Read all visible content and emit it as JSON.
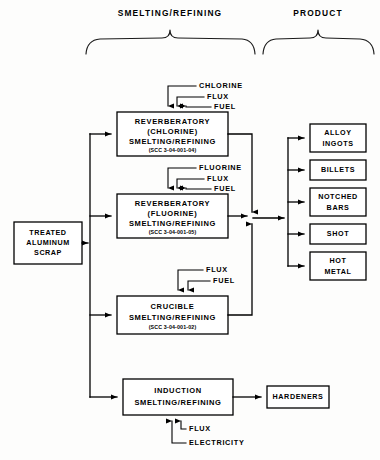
{
  "diagram": {
    "headers": [
      {
        "label": "SMELTING/REFINING",
        "x": 170,
        "y": 14
      },
      {
        "label": "PRODUCT",
        "x": 318,
        "y": 14
      }
    ],
    "feedstock": {
      "name": "treated-aluminum-scrap",
      "lines": [
        "TREATED",
        "ALUMINUM",
        "SCRAP"
      ],
      "x": 14,
      "y": 222,
      "w": 68,
      "h": 42
    },
    "processes": [
      {
        "name": "reverberatory-chlorine",
        "lines": [
          "REVERBERATORY",
          "(CHLORINE)",
          "SMELTING/REFINING"
        ],
        "scc": "(SCC 3-04-001-04)",
        "x": 117,
        "y": 112,
        "w": 111,
        "h": 44,
        "inputs": [
          "CHLORINE",
          "FLUX",
          "FUEL"
        ]
      },
      {
        "name": "reverberatory-fluorine",
        "lines": [
          "REVERBERATORY",
          "(FLUORINE)",
          "SMELTING/REFINING"
        ],
        "scc": "(SCC 3-04-001-05)",
        "x": 117,
        "y": 194,
        "w": 111,
        "h": 44,
        "inputs": [
          "FLUORINE",
          "FLUX",
          "FUEL"
        ]
      },
      {
        "name": "crucible",
        "lines": [
          "CRUCIBLE",
          "SMELTING/REFINING"
        ],
        "scc": "(SCC 3-04-001-02)",
        "x": 117,
        "y": 296,
        "w": 111,
        "h": 38,
        "inputs": [
          "FLUX",
          "FUEL"
        ]
      },
      {
        "name": "induction",
        "lines": [
          "INDUCTION",
          "SMELTING/REFINING"
        ],
        "scc": "",
        "x": 123,
        "y": 379,
        "w": 110,
        "h": 36,
        "inputs": [
          "FLUX",
          "ELECTRICITY"
        ]
      }
    ],
    "products": [
      {
        "name": "alloy-ingots",
        "lines": [
          "ALLOY",
          "INGOTS"
        ],
        "x": 310,
        "y": 124,
        "w": 56,
        "h": 28
      },
      {
        "name": "billets",
        "lines": [
          "BILLETS"
        ],
        "x": 310,
        "y": 160,
        "w": 56,
        "h": 20
      },
      {
        "name": "notched-bars",
        "lines": [
          "NOTCHED",
          "BARS"
        ],
        "x": 310,
        "y": 188,
        "w": 56,
        "h": 28
      },
      {
        "name": "shot",
        "lines": [
          "SHOT"
        ],
        "x": 310,
        "y": 224,
        "w": 56,
        "h": 20
      },
      {
        "name": "hot-metal",
        "lines": [
          "HOT",
          "METAL"
        ],
        "x": 310,
        "y": 252,
        "w": 56,
        "h": 28
      }
    ],
    "hardeners": {
      "name": "hardeners",
      "lines": [
        "HARDENERS"
      ],
      "x": 267,
      "y": 386,
      "w": 62,
      "h": 22
    },
    "input_labels": [
      {
        "text": "CHLORINE",
        "x": 199,
        "y": 86
      },
      {
        "text": "FLUX",
        "x": 207,
        "y": 97
      },
      {
        "text": "FUEL",
        "x": 214,
        "y": 107
      },
      {
        "text": "FLUORINE",
        "x": 199,
        "y": 168
      },
      {
        "text": "FLUX",
        "x": 207,
        "y": 179
      },
      {
        "text": "FUEL",
        "x": 214,
        "y": 189
      },
      {
        "text": "FLUX",
        "x": 206,
        "y": 270
      },
      {
        "text": "FUEL",
        "x": 213,
        "y": 281
      },
      {
        "text": "FLUX",
        "x": 189,
        "y": 429
      },
      {
        "text": "ELECTRICITY",
        "x": 189,
        "y": 443
      }
    ],
    "colors": {
      "line": "#000000",
      "box_fill": "#ffffff",
      "background": "#fdfdfc",
      "text": "#000000"
    }
  }
}
